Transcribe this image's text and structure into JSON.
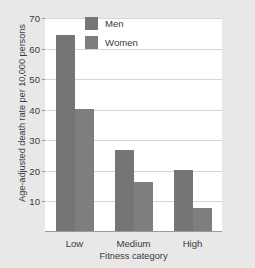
{
  "chart_data": {
    "type": "bar",
    "title": "",
    "xlabel": "Fitness category",
    "ylabel": "Age-adjusted death rate per 10,000 persons",
    "categories": [
      "Low",
      "Medium",
      "High"
    ],
    "series": [
      {
        "name": "Men",
        "values": [
          64,
          26.5,
          20
        ]
      },
      {
        "name": "Women",
        "values": [
          40,
          16,
          7.5
        ]
      }
    ],
    "ylim": [
      0,
      70
    ],
    "yticks": [
      70,
      60,
      50,
      40,
      30,
      20,
      10
    ],
    "grid": true,
    "legend_position": "top-center",
    "colors": {
      "men": "#757575",
      "women": "#7e7e7e",
      "plot_background": "#ffffff",
      "page_background": "#e8e8e8",
      "gridline": "#d6d6d6",
      "text": "#3a3a3a"
    }
  }
}
